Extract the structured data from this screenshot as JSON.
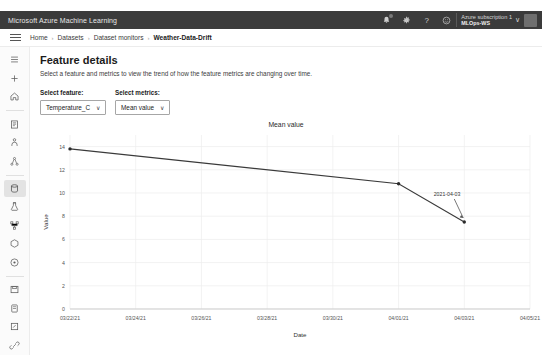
{
  "topbar": {
    "title": "Microsoft Azure Machine Learning",
    "icons": [
      {
        "name": "notifications-icon",
        "glyph": "bell"
      },
      {
        "name": "settings-gear-icon",
        "glyph": "gear"
      },
      {
        "name": "help-icon",
        "glyph": "question"
      },
      {
        "name": "feedback-icon",
        "glyph": "smiley"
      }
    ],
    "account": {
      "subscription": "Azure subscription 1",
      "workspace": "MLOps-WS",
      "chevron": "∨"
    }
  },
  "breadcrumb": {
    "separator": "›",
    "items": [
      "Home",
      "Datasets",
      "Dataset monitors",
      "Weather-Data-Drift"
    ]
  },
  "rail": {
    "items": [
      {
        "name": "sidebar-menu-icon",
        "glyph": "hamburger"
      },
      {
        "name": "sidebar-new-icon",
        "glyph": "plus"
      },
      {
        "name": "sidebar-home-icon",
        "glyph": "home"
      },
      {
        "name": "sidebar-notebooks-icon",
        "glyph": "notebook"
      },
      {
        "name": "sidebar-automl-icon",
        "glyph": "automl"
      },
      {
        "name": "sidebar-designer-icon",
        "glyph": "designer"
      },
      {
        "name": "sidebar-datasets-icon",
        "glyph": "datasets"
      },
      {
        "name": "sidebar-experiments-icon",
        "glyph": "experiment"
      },
      {
        "name": "sidebar-pipelines-icon",
        "glyph": "pipeline"
      },
      {
        "name": "sidebar-models-icon",
        "glyph": "model"
      },
      {
        "name": "sidebar-endpoints-icon",
        "glyph": "endpoint"
      },
      {
        "name": "sidebar-compute-icon",
        "glyph": "compute"
      },
      {
        "name": "sidebar-datastores-icon",
        "glyph": "datastore"
      },
      {
        "name": "sidebar-labeling-icon",
        "glyph": "labeling"
      },
      {
        "name": "sidebar-linked-icon",
        "glyph": "link"
      }
    ]
  },
  "page": {
    "title": "Feature details",
    "subtitle": "Select a feature and metrics to view the trend of how the feature metrics are changing over time."
  },
  "selectors": [
    {
      "name": "select-feature",
      "label": "Select feature:",
      "value": "Temperature_C",
      "chevron": "∨"
    },
    {
      "name": "select-metrics",
      "label": "Select metrics:",
      "value": "Mean value",
      "chevron": "∨"
    }
  ],
  "chart_data": {
    "type": "line",
    "title": "Mean value",
    "xlabel": "Date",
    "ylabel": "Value",
    "grid": true,
    "legend": false,
    "ylim": [
      0,
      15
    ],
    "yticks": [
      0,
      2,
      4,
      6,
      8,
      10,
      12,
      14
    ],
    "xticks": [
      "03/22/21",
      "03/24/21",
      "03/26/21",
      "03/28/21",
      "03/30/21",
      "04/01/21",
      "04/03/21",
      "04/05/21"
    ],
    "line_color": "#3a3a3a",
    "marker_color": "#2b2b2b",
    "series": [
      {
        "name": "Mean value",
        "x": [
          "03/22/21",
          "04/01/21",
          "04/03/21"
        ],
        "values": [
          13.8,
          10.8,
          7.5
        ]
      }
    ],
    "annotations": [
      {
        "name": "last-point-label",
        "text": "2021-04-03",
        "x": "04/03/21",
        "y": 7.5
      }
    ]
  }
}
